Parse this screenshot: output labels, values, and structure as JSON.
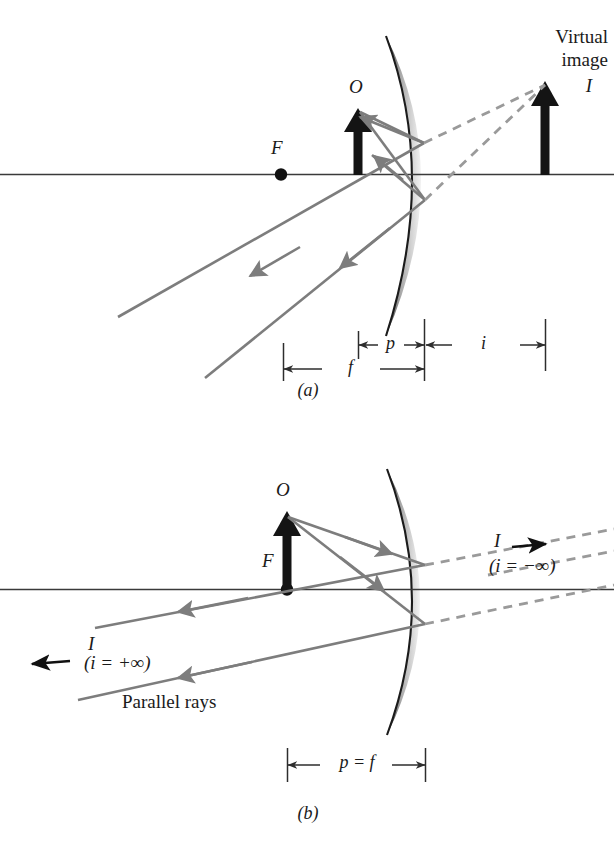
{
  "figure": {
    "title_semantic": "concave-mirror-ray-diagrams",
    "panels": [
      {
        "id": "a",
        "caption": "(a)",
        "labels": {
          "focal_point": "F",
          "object": "O",
          "image": "I",
          "virtual_image_line1": "Virtual",
          "virtual_image_line2": "image"
        },
        "dimensions": [
          {
            "name": "object-distance",
            "label": "p"
          },
          {
            "name": "image-distance",
            "label": "i"
          },
          {
            "name": "focal-length",
            "label": "f"
          }
        ]
      },
      {
        "id": "b",
        "caption": "(b)",
        "labels": {
          "focal_point": "F",
          "object": "O",
          "image_left": "I",
          "image_right": "I",
          "image_left_note": "(i = +∞)",
          "image_right_note": "(i = −∞)",
          "parallel_rays": "Parallel rays"
        },
        "dimensions": [
          {
            "name": "object-distance-equals-focal-length",
            "label": "p = f"
          }
        ]
      }
    ],
    "colors": {
      "ray": "#7d7d7d",
      "dashed_ray": "#9a9a9a",
      "axis": "#3a3a3a",
      "arrow_solid": "#141414",
      "mirror_edge": "#1e1e1e",
      "mirror_shade": "#b4b4b4",
      "text": "#1a1a1a",
      "background": "#ffffff"
    }
  }
}
